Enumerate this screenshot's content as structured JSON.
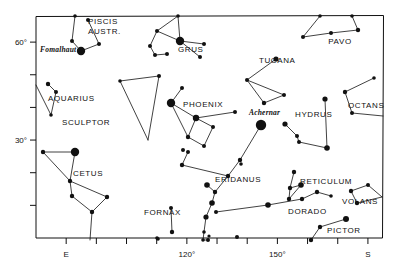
{
  "chart_data": {
    "type": "scatter",
    "title": "",
    "subtitle": "",
    "xlabel": "",
    "ylabel": "",
    "grid": false,
    "legend": null,
    "xlim": [
      70,
      185
    ],
    "ylim": [
      0,
      68
    ],
    "x_ticks": [
      {
        "value": 80,
        "label": "E"
      },
      {
        "value": 90,
        "label": ""
      },
      {
        "value": 100,
        "label": ""
      },
      {
        "value": 110,
        "label": ""
      },
      {
        "value": 120,
        "label": "120°"
      },
      {
        "value": 130,
        "label": ""
      },
      {
        "value": 140,
        "label": ""
      },
      {
        "value": 150,
        "label": "150°"
      },
      {
        "value": 160,
        "label": ""
      },
      {
        "value": 170,
        "label": ""
      },
      {
        "value": 180,
        "label": "S"
      }
    ],
    "y_ticks": [
      {
        "value": 60,
        "label": "60°"
      },
      {
        "value": 50,
        "label": ""
      },
      {
        "value": 40,
        "label": ""
      },
      {
        "value": 30,
        "label": "30°"
      },
      {
        "value": 20,
        "label": ""
      },
      {
        "value": 10,
        "label": ""
      }
    ],
    "constellation_labels": [
      {
        "name": "PISCIS AUSTR.",
        "lines": [
          "PISCIS",
          "AUSTR."
        ],
        "x": 88,
        "y": 24,
        "anchor": "start"
      },
      {
        "name": "GRUS",
        "lines": [
          "GRUS"
        ],
        "x": 178,
        "y": 52,
        "anchor": "start"
      },
      {
        "name": "TUCANA",
        "lines": [
          "TUCANA"
        ],
        "x": 259,
        "y": 63,
        "anchor": "start"
      },
      {
        "name": "PAVO",
        "lines": [
          "PAVO"
        ],
        "x": 340,
        "y": 44,
        "anchor": "middle"
      },
      {
        "name": "AQUARIUS",
        "lines": [
          "AQUARIUS"
        ],
        "x": 48,
        "y": 101,
        "anchor": "start"
      },
      {
        "name": "SCULPTOR",
        "lines": [
          "SCULPTOR"
        ],
        "x": 62,
        "y": 125,
        "anchor": "start"
      },
      {
        "name": "PHOENIX",
        "lines": [
          "PHOENIX"
        ],
        "x": 183,
        "y": 107,
        "anchor": "start"
      },
      {
        "name": "HYDRUS",
        "lines": [
          "HYDRUS"
        ],
        "x": 295,
        "y": 117,
        "anchor": "start"
      },
      {
        "name": "OCTANS",
        "lines": [
          "OCTANS"
        ],
        "x": 348,
        "y": 108,
        "anchor": "start"
      },
      {
        "name": "CETUS",
        "lines": [
          "CETUS"
        ],
        "x": 73,
        "y": 176,
        "anchor": "start"
      },
      {
        "name": "ERIDANUS",
        "lines": [
          "ERIDANUS"
        ],
        "x": 215,
        "y": 182,
        "anchor": "start"
      },
      {
        "name": "RETICULUM",
        "lines": [
          "RETICULUM"
        ],
        "x": 300,
        "y": 184,
        "anchor": "start"
      },
      {
        "name": "VOLANS",
        "lines": [
          "VOLANS"
        ],
        "x": 342,
        "y": 204,
        "anchor": "start"
      },
      {
        "name": "FORNAX",
        "lines": [
          "FORNAX"
        ],
        "x": 144,
        "y": 215,
        "anchor": "start"
      },
      {
        "name": "DORADO",
        "lines": [
          "DORADO"
        ],
        "x": 288,
        "y": 214,
        "anchor": "start"
      },
      {
        "name": "PICTOR",
        "lines": [
          "PICTOR"
        ],
        "x": 327,
        "y": 233,
        "anchor": "start"
      }
    ],
    "named_stars": [
      {
        "name": "Fomalhaut",
        "label_x": 40,
        "label_y": 52,
        "star_x": 81,
        "star_y": 51,
        "magnitude": "bright"
      },
      {
        "name": "Achernar",
        "label_x": 249,
        "label_y": 115,
        "star_x": 261,
        "star_y": 125,
        "magnitude": "bright"
      }
    ],
    "constellations": [
      {
        "name": "PISCIS AUSTR.",
        "stars": [
          {
            "x": 81,
            "y": 51,
            "size": 4.2
          },
          {
            "x": 72,
            "y": 41,
            "size": 2.0
          },
          {
            "x": 99,
            "y": 44,
            "size": 2.0
          },
          {
            "x": 88,
            "y": 20,
            "size": 2.0
          },
          {
            "x": 75,
            "y": 16,
            "size": 1.8
          }
        ],
        "links": [
          [
            0,
            1
          ],
          [
            0,
            2
          ],
          [
            1,
            4
          ],
          [
            3,
            2
          ]
        ]
      },
      {
        "name": "GRUS",
        "stars": [
          {
            "x": 180,
            "y": 41,
            "size": 4.2
          },
          {
            "x": 157,
            "y": 31,
            "size": 2.0
          },
          {
            "x": 150,
            "y": 46,
            "size": 2.0
          },
          {
            "x": 155,
            "y": 55,
            "size": 2.0
          },
          {
            "x": 167,
            "y": 54,
            "size": 2.0
          },
          {
            "x": 204,
            "y": 44,
            "size": 2.0
          },
          {
            "x": 200,
            "y": 57,
            "size": 2.0
          },
          {
            "x": 178,
            "y": 16,
            "size": 1.8
          }
        ],
        "links": [
          [
            0,
            1
          ],
          [
            1,
            2
          ],
          [
            2,
            3
          ],
          [
            3,
            4
          ],
          [
            0,
            5
          ],
          [
            0,
            6
          ],
          [
            0,
            7
          ],
          [
            1,
            7
          ]
        ]
      },
      {
        "name": "TUCANA",
        "stars": [
          {
            "x": 276,
            "y": 59,
            "size": 2.6
          },
          {
            "x": 247,
            "y": 80,
            "size": 2.0
          },
          {
            "x": 284,
            "y": 95,
            "size": 2.0
          },
          {
            "x": 264,
            "y": 103,
            "size": 2.2
          }
        ],
        "links": [
          [
            0,
            1
          ],
          [
            1,
            2
          ],
          [
            1,
            3
          ],
          [
            3,
            2
          ]
        ]
      },
      {
        "name": "PAVO",
        "stars": [
          {
            "x": 303,
            "y": 37,
            "size": 2.0
          },
          {
            "x": 331,
            "y": 33,
            "size": 2.0
          },
          {
            "x": 358,
            "y": 30,
            "size": 2.2
          },
          {
            "x": 320,
            "y": 16,
            "size": 1.8
          },
          {
            "x": 352,
            "y": 16,
            "size": 1.8
          }
        ],
        "links": [
          [
            0,
            1
          ],
          [
            1,
            2
          ],
          [
            0,
            3
          ],
          [
            2,
            4
          ]
        ]
      },
      {
        "name": "AQUARIUS",
        "stars": [
          {
            "x": 48,
            "y": 84,
            "size": 2.2
          },
          {
            "x": 56,
            "y": 92,
            "size": 2.0
          },
          {
            "x": 51,
            "y": 115,
            "size": 1.8
          },
          {
            "x": 36,
            "y": 85,
            "size": 0
          }
        ],
        "links": [
          [
            0,
            1
          ],
          [
            1,
            2
          ],
          [
            2,
            3
          ]
        ]
      },
      {
        "name": "SCULPTOR",
        "stars": [
          {
            "x": 120,
            "y": 81,
            "size": 1.8
          },
          {
            "x": 159,
            "y": 76,
            "size": 2.0
          },
          {
            "x": 148,
            "y": 140,
            "size": 0
          }
        ],
        "links": [
          [
            0,
            1
          ],
          [
            1,
            2
          ],
          [
            2,
            0
          ]
        ]
      },
      {
        "name": "PHOENIX",
        "stars": [
          {
            "x": 171,
            "y": 103,
            "size": 4.2
          },
          {
            "x": 182,
            "y": 88,
            "size": 2.0
          },
          {
            "x": 196,
            "y": 118,
            "size": 3.2
          },
          {
            "x": 188,
            "y": 137,
            "size": 2.2
          },
          {
            "x": 204,
            "y": 146,
            "size": 2.0
          },
          {
            "x": 213,
            "y": 127,
            "size": 2.0
          },
          {
            "x": 235,
            "y": 112,
            "size": 2.0
          }
        ],
        "links": [
          [
            0,
            1
          ],
          [
            0,
            2
          ],
          [
            0,
            3
          ],
          [
            2,
            3
          ],
          [
            3,
            4
          ],
          [
            4,
            5
          ],
          [
            2,
            5
          ],
          [
            2,
            6
          ]
        ]
      },
      {
        "name": "ACHERNAR",
        "stars": [
          {
            "x": 261,
            "y": 125,
            "size": 5.2
          }
        ],
        "links": []
      },
      {
        "name": "HYDRUS",
        "stars": [
          {
            "x": 285,
            "y": 124,
            "size": 2.6
          },
          {
            "x": 297,
            "y": 136,
            "size": 2.0
          },
          {
            "x": 299,
            "y": 142,
            "size": 2.0
          },
          {
            "x": 327,
            "y": 148,
            "size": 2.8
          },
          {
            "x": 325,
            "y": 99,
            "size": 2.6
          }
        ],
        "links": [
          [
            0,
            1
          ],
          [
            1,
            2
          ],
          [
            2,
            3
          ],
          [
            3,
            4
          ]
        ]
      },
      {
        "name": "OCTANS",
        "stars": [
          {
            "x": 345,
            "y": 92,
            "size": 2.2
          },
          {
            "x": 352,
            "y": 113,
            "size": 2.0
          },
          {
            "x": 374,
            "y": 78,
            "size": 1.8
          },
          {
            "x": 383,
            "y": 116,
            "size": 0
          }
        ],
        "links": [
          [
            0,
            1
          ],
          [
            0,
            2
          ],
          [
            1,
            3
          ]
        ]
      },
      {
        "name": "CETUS",
        "stars": [
          {
            "x": 75,
            "y": 152,
            "size": 4.2
          },
          {
            "x": 43,
            "y": 152,
            "size": 2.2
          },
          {
            "x": 70,
            "y": 181,
            "size": 2.2
          },
          {
            "x": 72,
            "y": 196,
            "size": 2.2
          },
          {
            "x": 92,
            "y": 212,
            "size": 2.2
          },
          {
            "x": 107,
            "y": 197,
            "size": 2.2
          },
          {
            "x": 90,
            "y": 240,
            "size": 0
          }
        ],
        "links": [
          [
            0,
            1
          ],
          [
            1,
            2
          ],
          [
            0,
            2
          ],
          [
            2,
            3
          ],
          [
            3,
            4
          ],
          [
            4,
            5
          ],
          [
            5,
            2
          ],
          [
            4,
            6
          ]
        ]
      },
      {
        "name": "ERIDANUS",
        "stars": [
          {
            "x": 261,
            "y": 125,
            "size": 0
          },
          {
            "x": 240,
            "y": 160,
            "size": 2.2
          },
          {
            "x": 228,
            "y": 176,
            "size": 2.2
          },
          {
            "x": 215,
            "y": 192,
            "size": 2.2
          },
          {
            "x": 212,
            "y": 203,
            "size": 2.8
          },
          {
            "x": 207,
            "y": 185,
            "size": 2.8
          },
          {
            "x": 206,
            "y": 217,
            "size": 2.6
          },
          {
            "x": 204,
            "y": 232,
            "size": 1.8
          },
          {
            "x": 203,
            "y": 240,
            "size": 1.8
          },
          {
            "x": 208,
            "y": 240,
            "size": 2.0
          },
          {
            "x": 209,
            "y": 236,
            "size": 1.6
          },
          {
            "x": 182,
            "y": 165,
            "size": 2.2
          },
          {
            "x": 188,
            "y": 152,
            "size": 2.0
          }
        ],
        "links": [
          [
            0,
            1
          ],
          [
            1,
            2
          ],
          [
            2,
            3
          ],
          [
            3,
            4
          ],
          [
            4,
            6
          ],
          [
            6,
            7
          ],
          [
            7,
            8
          ],
          [
            8,
            9
          ],
          [
            3,
            5
          ],
          [
            2,
            11
          ],
          [
            11,
            12
          ]
        ]
      },
      {
        "name": "FORNAX",
        "stars": [
          {
            "x": 171,
            "y": 208,
            "size": 2.0
          },
          {
            "x": 172,
            "y": 232,
            "size": 2.2
          },
          {
            "x": 157,
            "y": 238,
            "size": 1.8
          }
        ],
        "links": [
          [
            0,
            1
          ]
        ]
      },
      {
        "name": "RETICULUM",
        "stars": [
          {
            "x": 294,
            "y": 172,
            "size": 2.2
          },
          {
            "x": 290,
            "y": 188,
            "size": 2.2
          },
          {
            "x": 301,
            "y": 185,
            "size": 2.8
          },
          {
            "x": 289,
            "y": 199,
            "size": 2.2
          }
        ],
        "links": [
          [
            0,
            1
          ],
          [
            1,
            2
          ],
          [
            2,
            3
          ],
          [
            3,
            1
          ]
        ]
      },
      {
        "name": "DORADO",
        "stars": [
          {
            "x": 268,
            "y": 205,
            "size": 2.8
          },
          {
            "x": 302,
            "y": 199,
            "size": 2.2
          },
          {
            "x": 317,
            "y": 192,
            "size": 2.2
          },
          {
            "x": 331,
            "y": 196,
            "size": 1.8
          },
          {
            "x": 216,
            "y": 212,
            "size": 2.0
          }
        ],
        "links": [
          [
            0,
            1
          ],
          [
            1,
            2
          ],
          [
            0,
            4
          ],
          [
            2,
            3
          ]
        ]
      },
      {
        "name": "VOLANS",
        "stars": [
          {
            "x": 351,
            "y": 191,
            "size": 2.2
          },
          {
            "x": 368,
            "y": 185,
            "size": 2.0
          },
          {
            "x": 357,
            "y": 203,
            "size": 2.2
          },
          {
            "x": 382,
            "y": 197,
            "size": 0
          }
        ],
        "links": [
          [
            0,
            1
          ],
          [
            0,
            2
          ],
          [
            2,
            3
          ],
          [
            1,
            3
          ]
        ]
      },
      {
        "name": "PICTOR",
        "stars": [
          {
            "x": 346,
            "y": 219,
            "size": 3.0
          },
          {
            "x": 320,
            "y": 227,
            "size": 2.2
          },
          {
            "x": 311,
            "y": 240,
            "size": 2.2
          }
        ],
        "links": [
          [
            0,
            1
          ],
          [
            1,
            2
          ]
        ]
      },
      {
        "name": "SPARSE",
        "stars": [
          {
            "x": 183,
            "y": 150,
            "size": 2.0
          },
          {
            "x": 237,
            "y": 237,
            "size": 2.0
          },
          {
            "x": 158,
            "y": 239,
            "size": 1.8
          },
          {
            "x": 241,
            "y": 164,
            "size": 1.8
          },
          {
            "x": 270,
            "y": 16,
            "size": 0
          }
        ],
        "links": []
      }
    ]
  },
  "frame": {
    "left": 36,
    "top": 16,
    "right": 383,
    "bottom": 238
  },
  "axis_labels": {
    "x_e": "E",
    "x_120": "120°",
    "x_150": "150°",
    "x_s": "S",
    "y_60": "60°",
    "y_30": "30°"
  },
  "colors": {
    "ink": "#111111",
    "background": "#ffffff"
  }
}
